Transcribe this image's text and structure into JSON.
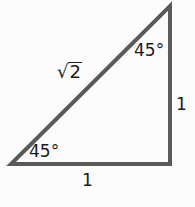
{
  "diagram": {
    "stroke_color": "#5a5a5a",
    "text_color": "#1c1c1c",
    "vertices": {
      "bottom_left": {
        "x": 11,
        "y": 164
      },
      "bottom_right": {
        "x": 170,
        "y": 164
      },
      "top_right": {
        "x": 170,
        "y": 6
      }
    },
    "labels": {
      "hypotenuse": {
        "radical_sign": "√",
        "radicand": "2"
      },
      "top_angle": "45°",
      "bottom_angle": "45°",
      "vertical_side": "1",
      "bottom_side": "1"
    }
  }
}
